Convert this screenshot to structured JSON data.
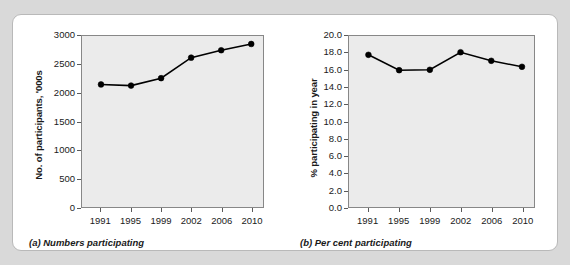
{
  "figure": {
    "background_color": "#d9d9d9",
    "panel_color": "#ffffff",
    "plot_area_color": "#ebebeb",
    "series_color": "#000000"
  },
  "chart_data": [
    {
      "type": "line",
      "panel": "a",
      "caption": "(a) Numbers participating",
      "title": "",
      "xlabel": "",
      "ylabel": "No. of participants, '000s",
      "categories": [
        "1991",
        "1995",
        "1999",
        "2002",
        "2006",
        "2010"
      ],
      "values": [
        2150,
        2130,
        2260,
        2620,
        2750,
        2860
      ],
      "ylim": [
        0,
        3000
      ],
      "yticks": [
        "0",
        "500",
        "1000",
        "1500",
        "2000",
        "2500",
        "3000"
      ],
      "ytick_values": [
        0,
        500,
        1000,
        1500,
        2000,
        2500,
        3000
      ],
      "grid": false,
      "legend": "none",
      "marker": "filled-circle"
    },
    {
      "type": "line",
      "panel": "b",
      "caption": "(b) Per cent participating",
      "title": "",
      "xlabel": "",
      "ylabel": "% participating in year",
      "categories": [
        "1991",
        "1995",
        "1999",
        "2002",
        "2006",
        "2010"
      ],
      "values": [
        17.8,
        16.0,
        16.05,
        18.1,
        17.1,
        16.4
      ],
      "ylim": [
        0,
        20
      ],
      "yticks": [
        "0.0",
        "2.0",
        "4.0",
        "6.0",
        "8.0",
        "10.0",
        "12.0",
        "14.0",
        "16.0",
        "18.0",
        "20.0"
      ],
      "ytick_values": [
        0,
        2,
        4,
        6,
        8,
        10,
        12,
        14,
        16,
        18,
        20
      ],
      "grid": false,
      "legend": "none",
      "marker": "filled-circle"
    }
  ]
}
